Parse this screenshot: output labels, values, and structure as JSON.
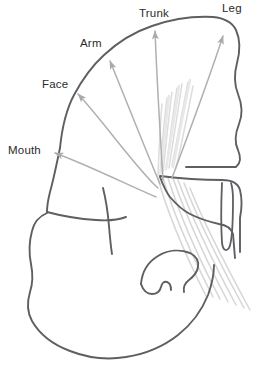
{
  "figure": {
    "kind": "anatomical-line-diagram",
    "background_color": "#ffffff",
    "outline_color": "#5f5f63",
    "arrow_color": "#b0b0b0",
    "fiber_color": "#d8d8d8",
    "label_color": "#2b2b2b"
  },
  "labels": [
    {
      "id": "trunk",
      "text": "Trunk",
      "x": 139,
      "y": 8
    },
    {
      "id": "leg",
      "text": "Leg",
      "x": 222,
      "y": 3
    },
    {
      "id": "arm",
      "text": "Arm",
      "x": 80,
      "y": 38
    },
    {
      "id": "face",
      "text": "Face",
      "x": 42,
      "y": 79
    },
    {
      "id": "mouth",
      "text": "Mouth",
      "x": 8,
      "y": 145
    }
  ],
  "projection_arrows": [
    {
      "id": "arrow-leg",
      "target": "Leg",
      "from_x": 172,
      "from_y": 178,
      "to_x": 222,
      "to_y": 34
    },
    {
      "id": "arrow-trunk",
      "target": "Trunk",
      "from_x": 162,
      "from_y": 180,
      "to_x": 155,
      "to_y": 28
    },
    {
      "id": "arrow-arm",
      "target": "Arm",
      "from_x": 160,
      "from_y": 184,
      "to_x": 108,
      "to_y": 58
    },
    {
      "id": "arrow-face",
      "target": "Face",
      "from_x": 158,
      "from_y": 188,
      "to_x": 76,
      "to_y": 92
    },
    {
      "id": "arrow-mouth",
      "target": "Mouth",
      "from_x": 156,
      "from_y": 196,
      "to_x": 52,
      "to_y": 152
    }
  ],
  "structures": [
    {
      "id": "cerebral-hemisphere-outline",
      "label": "cerebral hemisphere outline"
    },
    {
      "id": "sylvian-fissure",
      "label": "sylvian fissure"
    },
    {
      "id": "temporal-lobe-outline",
      "label": "temporal lobe outline"
    },
    {
      "id": "internal-capsule-fibers",
      "label": "internal capsule fiber fan"
    },
    {
      "id": "corticospinal-tract",
      "label": "descending corticospinal tract"
    },
    {
      "id": "midline-ventricle",
      "label": "midline ventricular slit"
    },
    {
      "id": "uncus-hook",
      "label": "uncal hook structure"
    },
    {
      "id": "thalamus-notch",
      "label": "thalamic notch"
    }
  ]
}
